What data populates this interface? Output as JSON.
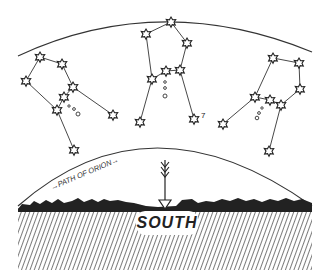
{
  "illustration": {
    "subject": "Orion's path across the southern sky",
    "path_label": "PATH OF ORION",
    "direction_label": "SOUTH",
    "constellations": [
      {
        "name": "orion-rising",
        "stars": [
          [
            40,
            57
          ],
          [
            62,
            64
          ],
          [
            26,
            81
          ],
          [
            73,
            87
          ],
          [
            64,
            97
          ],
          [
            57,
            110
          ],
          [
            113,
            115
          ],
          [
            74,
            150
          ]
        ],
        "belt_dots": [
          [
            69,
            106
          ],
          [
            74,
            108
          ],
          [
            78,
            113
          ]
        ]
      },
      {
        "name": "orion-culminating",
        "stars": [
          [
            171,
            22
          ],
          [
            146,
            34
          ],
          [
            187,
            43
          ],
          [
            180,
            70
          ],
          [
            166,
            71
          ],
          [
            152,
            79
          ],
          [
            140,
            122
          ],
          [
            194,
            119
          ]
        ],
        "belt_dots": [
          [
            165,
            82
          ],
          [
            165,
            88
          ],
          [
            165,
            97
          ]
        ],
        "annotation": "7"
      },
      {
        "name": "orion-setting",
        "stars": [
          [
            273,
            58
          ],
          [
            299,
            63
          ],
          [
            300,
            89
          ],
          [
            255,
            97
          ],
          [
            270,
            100
          ],
          [
            281,
            105
          ],
          [
            223,
            124
          ],
          [
            269,
            151
          ]
        ],
        "belt_dots": [
          [
            262,
            108
          ],
          [
            259,
            113
          ],
          [
            257,
            118
          ]
        ]
      }
    ],
    "colors": {
      "ink": "#222222",
      "paper": "#ffffff"
    }
  }
}
